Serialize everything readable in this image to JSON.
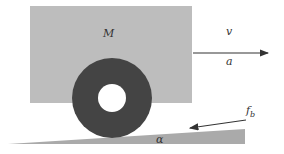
{
  "diagram": {
    "labels": {
      "mass": "M",
      "velocity": "v",
      "acceleration": "a",
      "brake_force": "f",
      "brake_force_sub": "b",
      "angle": "α"
    },
    "colors": {
      "body": "#bdbdbd",
      "wheel": "#444444",
      "wheel_hub": "#ffffff",
      "incline": "#aaaaaa",
      "arrow": "#333333"
    }
  }
}
